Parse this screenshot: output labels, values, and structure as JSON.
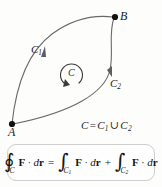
{
  "diagram": {
    "points": [
      {
        "id": "A",
        "label": "A",
        "x": 12,
        "y": 124
      },
      {
        "id": "B",
        "label": "B",
        "x": 115,
        "y": 17
      }
    ],
    "curves": [
      {
        "id": "C1",
        "label": "C",
        "subscript": "1",
        "description": "upper-left arc from A to B",
        "direction": "A to B"
      },
      {
        "id": "C2",
        "label": "C",
        "subscript": "2",
        "description": "lower-right arc from B to A",
        "direction": "B to A"
      }
    ],
    "orientation_marker": {
      "label": "C",
      "direction": "counterclockwise"
    },
    "union_statement": {
      "lhs": "C",
      "equals": "=",
      "term1": "C",
      "term1_sub": "1",
      "union_symbol": "∪",
      "term2": "C",
      "term2_sub": "2"
    },
    "colors": {
      "curve": "#6a6a6a",
      "point": "#111111",
      "label": "#1b1b1b",
      "orientation_marker": "#3a3a3a"
    }
  },
  "formula": {
    "closed_integral_symbol": "∮",
    "integral_symbol": "∫",
    "lhs_subscript": "C",
    "rhs1_subscript": "C",
    "rhs1_subscript_num": "1",
    "rhs2_subscript": "C",
    "rhs2_subscript_num": "2",
    "field": "F",
    "dot": "·",
    "differential_d": "d",
    "differential_r": "r",
    "equals": "=",
    "plus": "+",
    "box_border_color": "#cfcfcf",
    "box_background": "#fefefe"
  }
}
